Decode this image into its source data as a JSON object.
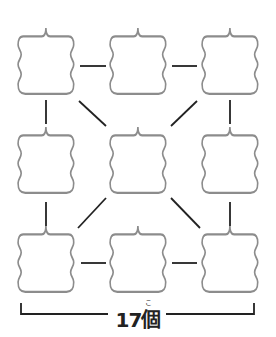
{
  "diagram": {
    "total_label": "17個",
    "ruby": "こ",
    "grid": {
      "rows": 3,
      "cols": 3
    },
    "boxes": [
      {
        "row": 0,
        "col": 0,
        "text": ""
      },
      {
        "row": 0,
        "col": 1,
        "text": ""
      },
      {
        "row": 0,
        "col": 2,
        "text": ""
      },
      {
        "row": 1,
        "col": 0,
        "text": ""
      },
      {
        "row": 1,
        "col": 1,
        "text": ""
      },
      {
        "row": 1,
        "col": 2,
        "text": ""
      },
      {
        "row": 2,
        "col": 0,
        "text": ""
      },
      {
        "row": 2,
        "col": 1,
        "text": ""
      },
      {
        "row": 2,
        "col": 2,
        "text": ""
      }
    ],
    "connections": 16,
    "colors": {
      "box_stroke": "#8c8c8c",
      "line": "#222222"
    }
  }
}
